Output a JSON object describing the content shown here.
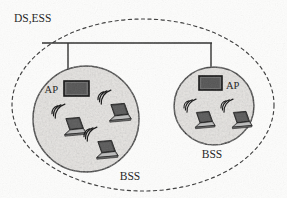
{
  "diagram": {
    "title_label": "DS,ESS",
    "outer_boundary": {
      "name": "distribution-system-ess-boundary",
      "style": "dashed-ellipse",
      "cx": 143,
      "cy": 105,
      "rx": 131,
      "ry": 86,
      "stroke": "#3a3a3a"
    },
    "backbone": {
      "name": "distribution-system-backbone",
      "x1": 42,
      "x2": 212,
      "y": 43,
      "stroke": "#2b2b2b"
    },
    "cells": [
      {
        "id": "bss-left",
        "label": "BSS",
        "label_x": 130,
        "label_y": 179,
        "cx": 86,
        "cy": 119,
        "rx": 53,
        "ry": 53,
        "fill": "#e6e4e1",
        "stroke": "#1f1f1f",
        "ap": {
          "label": "AP",
          "label_position": "left",
          "label_x": 58,
          "label_y": 92,
          "x": 64,
          "y": 81,
          "w": 25,
          "h": 15,
          "fill": "#6d6d6d",
          "stroke": "#111111"
        },
        "drop_line_x": 68,
        "drop_line_y1": 43,
        "drop_line_y2": 81,
        "stations": [
          {
            "name": "laptop-station",
            "x": 60,
            "y": 117,
            "scale": 1.0,
            "wave_side": "left"
          },
          {
            "name": "laptop-station",
            "x": 105,
            "y": 103,
            "scale": 1.0,
            "wave_side": "left"
          },
          {
            "name": "laptop-station",
            "x": 92,
            "y": 140,
            "scale": 1.0,
            "wave_side": "left"
          }
        ]
      },
      {
        "id": "bss-right",
        "label": "BSS",
        "label_x": 212,
        "label_y": 157,
        "cx": 214,
        "cy": 106,
        "rx": 40,
        "ry": 39,
        "fill": "#e6e4e1",
        "stroke": "#1f1f1f",
        "ap": {
          "label": "AP",
          "label_position": "right",
          "label_x": 226,
          "label_y": 89,
          "x": 199,
          "y": 76,
          "w": 23,
          "h": 14,
          "fill": "#6d6d6d",
          "stroke": "#111111"
        },
        "drop_line_x": 211,
        "drop_line_y1": 43,
        "drop_line_y2": 76,
        "stations": [
          {
            "name": "laptop-station",
            "x": 192,
            "y": 112,
            "scale": 0.92,
            "wave_side": "left"
          },
          {
            "name": "laptop-station",
            "x": 229,
            "y": 112,
            "scale": 0.92,
            "wave_side": "left"
          }
        ]
      }
    ],
    "colors": {
      "ink": "#1a1a1a",
      "cell_fill": "#e6e4e1",
      "ap_fill": "#6d6d6d",
      "laptop_screen": "#4a4a4a",
      "laptop_base": "#8e8e8e",
      "paper": "#fdfdfc"
    }
  }
}
